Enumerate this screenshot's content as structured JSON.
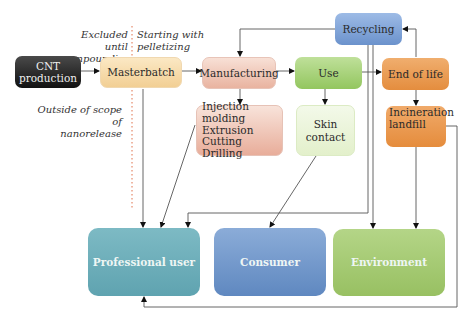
{
  "diagram": {
    "notes": {
      "excluded": "Excluded until compounding",
      "excluded_l1": "Excluded until",
      "excluded_l2": "compounding",
      "starting": "Starting with pelletizing",
      "starting_l1": "Starting with",
      "starting_l2": "pelletizing",
      "outside": "Outside of scope of nanorelease",
      "outside_l1": "Outside of scope of",
      "outside_l2": "nanorelease"
    },
    "nodes": {
      "cnt_production": {
        "label_l1": "CNT",
        "label_l2": "production",
        "color": "#1e1e1e"
      },
      "masterbatch": {
        "label": "Masterbatch",
        "color": "#f6d9a6"
      },
      "manufacturing": {
        "label": "Manufacturing",
        "color": "#f0c6b6"
      },
      "use": {
        "label": "Use",
        "color": "#a6d27a"
      },
      "end_of_life": {
        "label": "End of life",
        "color": "#e9994f"
      },
      "recycling": {
        "label": "Recycling",
        "color": "#7fa3d6"
      },
      "processes": {
        "items": [
          "Injection molding",
          "Extrusion",
          "Cutting",
          "Drilling"
        ],
        "color": "#efc1b2"
      },
      "skin_contact": {
        "label": "Skin contact",
        "color": "#eef6dd"
      },
      "incineration": {
        "label_l1": "Incineration",
        "label_l2": "landfill",
        "color": "#e9994f"
      },
      "professional_user": {
        "label": "Professional user",
        "color": "#6fb1bd"
      },
      "consumer": {
        "label": "Consumer",
        "color": "#6f95c8"
      },
      "environment": {
        "label": "Environment",
        "color": "#a3c96f"
      }
    },
    "divider_color": "#e0704a"
  }
}
